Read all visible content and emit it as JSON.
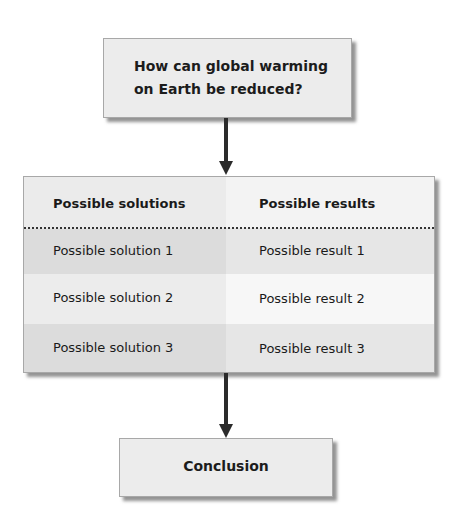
{
  "question": {
    "line1": "How can global warming",
    "line2": "on Earth be reduced?"
  },
  "table": {
    "headers": [
      "Possible solutions",
      "Possible results"
    ],
    "rows": [
      [
        "Possible solution 1",
        "Possible result 1"
      ],
      [
        "Possible solution 2",
        "Possible result 2"
      ],
      [
        "Possible solution 3",
        "Possible result 3"
      ]
    ],
    "colors": {
      "header_left": "#ebebeb",
      "header_right": "#f3f3f3",
      "row_dark_left": "#dcdcdc",
      "row_dark_right": "#e6e6e6",
      "row_light_left": "#ececec",
      "row_light_right": "#f7f7f7"
    }
  },
  "conclusion": {
    "label": "Conclusion"
  }
}
